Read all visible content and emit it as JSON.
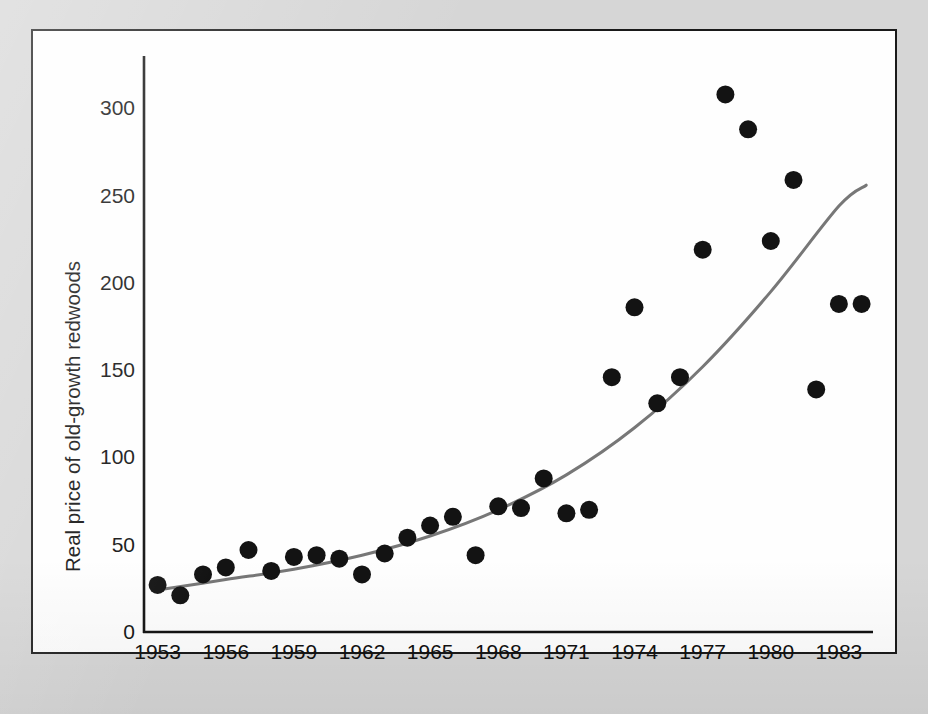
{
  "figure": {
    "background_color": "#fefefe",
    "page_background_color": "#d6d6d6",
    "frame_border_color": "#1a1a1a"
  },
  "axis": {
    "line_color": "#111111",
    "y_label": "Real price of old-growth redwoods",
    "y_ticks": [
      "0",
      "50",
      "100",
      "150",
      "200",
      "250",
      "300"
    ],
    "x_ticks": [
      "1953",
      "1956",
      "1959",
      "1962",
      "1965",
      "1968",
      "1971",
      "1974",
      "1977",
      "1980",
      "1983"
    ]
  },
  "marker": {
    "color": "#131313",
    "shape": "circle",
    "radius_px": 9
  },
  "trend": {
    "color": "#777777",
    "width_px": 3,
    "shape": "exponential-fit-curve"
  },
  "chart_data": {
    "type": "scatter",
    "title": "",
    "xlabel": "",
    "ylabel": "Real price of old-growth redwoods",
    "xlim": [
      1952.4,
      1984.5
    ],
    "ylim": [
      0,
      330
    ],
    "x_tick_values": [
      1953,
      1956,
      1959,
      1962,
      1965,
      1968,
      1971,
      1974,
      1977,
      1980,
      1983
    ],
    "y_tick_values": [
      0,
      50,
      100,
      150,
      200,
      250,
      300
    ],
    "grid": false,
    "legend": null,
    "series": [
      {
        "name": "Real price of old-growth redwoods",
        "type": "scatter",
        "x": [
          1953,
          1954,
          1955,
          1956,
          1957,
          1958,
          1959,
          1960,
          1961,
          1962,
          1963,
          1964,
          1965,
          1966,
          1967,
          1968,
          1969,
          1970,
          1971,
          1972,
          1973,
          1974,
          1975,
          1976,
          1977,
          1978,
          1979,
          1980,
          1981,
          1982,
          1983,
          1984
        ],
        "y": [
          27,
          21,
          33,
          37,
          47,
          35,
          43,
          44,
          42,
          33,
          45,
          54,
          61,
          66,
          44,
          72,
          71,
          88,
          68,
          70,
          146,
          186,
          131,
          146,
          219,
          308,
          288,
          224,
          259,
          139,
          188,
          188
        ]
      },
      {
        "name": "fitted exponential trend",
        "type": "line",
        "x": [
          1953,
          1956,
          1959,
          1962,
          1965,
          1968,
          1971,
          1974,
          1977,
          1980,
          1983,
          1984.2
        ],
        "y": [
          24,
          30,
          36,
          44,
          55,
          70,
          90,
          117,
          152,
          195,
          244,
          256
        ]
      }
    ]
  }
}
